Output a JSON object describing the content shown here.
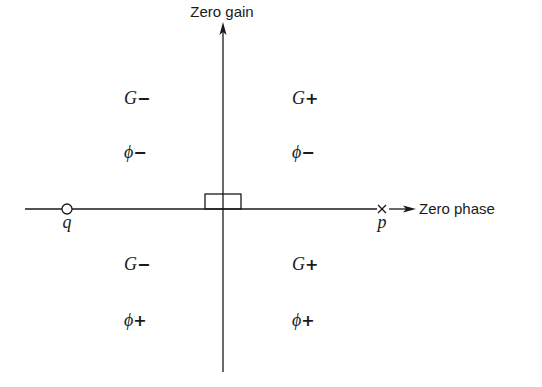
{
  "axes": {
    "vertical_label": "Zero gain",
    "horizontal_label": "Zero phase"
  },
  "markers": {
    "zero": {
      "label": "q",
      "symbol": "circle"
    },
    "pole": {
      "label": "p",
      "symbol": "cross"
    }
  },
  "quadrants": {
    "upper_left": {
      "gain": "G",
      "gain_sign": "−",
      "phase": "ϕ",
      "phase_sign": "−"
    },
    "upper_right": {
      "gain": "G",
      "gain_sign": "+",
      "phase": "ϕ",
      "phase_sign": "−"
    },
    "lower_left": {
      "gain": "G",
      "gain_sign": "−",
      "phase": "ϕ",
      "phase_sign": "+"
    },
    "lower_right": {
      "gain": "G",
      "gain_sign": "+",
      "phase": "ϕ",
      "phase_sign": "+"
    }
  },
  "colors": {
    "ink": "#1a1a1a",
    "background": "#ffffff"
  }
}
